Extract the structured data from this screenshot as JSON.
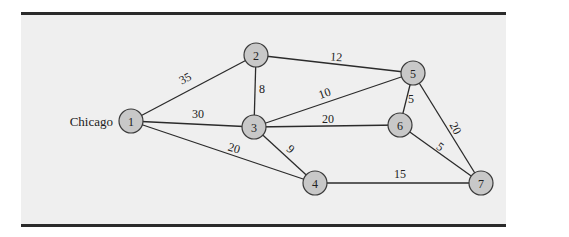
{
  "diagram": {
    "type": "network",
    "origin_label": "Chicago",
    "nodes": [
      {
        "id": "1",
        "label": "1",
        "x": 131,
        "y": 121
      },
      {
        "id": "2",
        "label": "2",
        "x": 256,
        "y": 55
      },
      {
        "id": "3",
        "label": "3",
        "x": 254,
        "y": 127
      },
      {
        "id": "4",
        "label": "4",
        "x": 315,
        "y": 183
      },
      {
        "id": "5",
        "label": "5",
        "x": 413,
        "y": 73
      },
      {
        "id": "6",
        "label": "6",
        "x": 400,
        "y": 125
      },
      {
        "id": "7",
        "label": "7",
        "x": 481,
        "y": 183
      }
    ],
    "edges": [
      {
        "from": "1",
        "to": "2",
        "weight": "35",
        "lx": 187,
        "ly": 82,
        "rot": -28
      },
      {
        "from": "1",
        "to": "3",
        "weight": "30",
        "lx": 198,
        "ly": 118,
        "rot": 0
      },
      {
        "from": "1",
        "to": "4",
        "weight": "20",
        "lx": 233,
        "ly": 152,
        "rot": 16
      },
      {
        "from": "2",
        "to": "3",
        "weight": "8",
        "lx": 262,
        "ly": 93,
        "rot": 0
      },
      {
        "from": "2",
        "to": "5",
        "weight": "12",
        "lx": 336,
        "ly": 61,
        "rot": 4
      },
      {
        "from": "3",
        "to": "5",
        "weight": "10",
        "lx": 326,
        "ly": 97,
        "rot": -20
      },
      {
        "from": "3",
        "to": "6",
        "weight": "20",
        "lx": 328,
        "ly": 123,
        "rot": 0
      },
      {
        "from": "3",
        "to": "4",
        "weight": "9",
        "lx": 288,
        "ly": 152,
        "rot": 42
      },
      {
        "from": "5",
        "to": "6",
        "weight": "5",
        "lx": 411,
        "ly": 103,
        "rot": 0
      },
      {
        "from": "5",
        "to": "7",
        "weight": "20",
        "lx": 452,
        "ly": 130,
        "rot": 62
      },
      {
        "from": "6",
        "to": "7",
        "weight": "5",
        "lx": 438,
        "ly": 150,
        "rot": 35
      },
      {
        "from": "4",
        "to": "7",
        "weight": "15",
        "lx": 400,
        "ly": 178,
        "rot": 0
      }
    ]
  },
  "colors": {
    "background": "#efefef",
    "node_fill": "#c8c8c8",
    "line": "#2b2b2b"
  }
}
